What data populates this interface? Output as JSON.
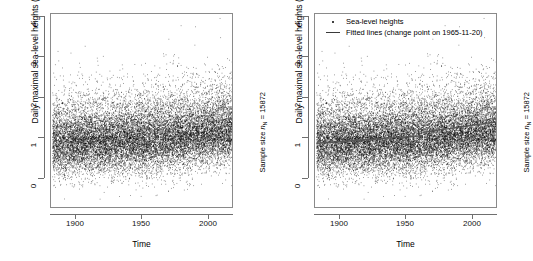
{
  "figure": {
    "panels": [
      {
        "id": "left",
        "axis_x_title": "Time",
        "axis_y_title": "Daily maximal sea-level heights (in m above NAP) of winters",
        "side_note_prefix": "Sample size ",
        "side_note_symbol": "n",
        "side_note_subscript": "N",
        "side_note_suffix": " = 15872",
        "has_legend": false
      },
      {
        "id": "right",
        "axis_x_title": "Time",
        "axis_y_title": "Daily maximal sea-level heights (in m above NAP) of winters",
        "side_note_prefix": "Sample size ",
        "side_note_symbol": "n",
        "side_note_subscript": "N",
        "side_note_suffix": " = 15872",
        "has_legend": true,
        "legend": {
          "points_label": "Sea-level heights",
          "line_label": "Fitted lines (change point on 1965-11-20)"
        }
      }
    ]
  },
  "chart_data": [
    {
      "type": "scatter",
      "title": "",
      "xlabel": "Time",
      "ylabel": "Daily maximal sea-level heights (in m above NAP) of winters",
      "xlim": [
        1886,
        2020
      ],
      "ylim": [
        -0.6,
        4.0
      ],
      "xticks": [
        1900,
        1950,
        2000
      ],
      "yticks": [
        0,
        1,
        2,
        3,
        4
      ],
      "grid": false,
      "legend": null,
      "annotation": "Sample size nN = 15872",
      "n_points": 15872,
      "point_color": "#000000",
      "description": "Dense black scatter cloud of daily maximal winter sea-level heights from ~1887 to ~2020; bulk of mass between 0.4 and 1.9 m, centred near 1.0-1.2 m, with sparse outliers up to 3.8 m and down to -0.45 m.",
      "density_profile": {
        "x_years": [
          1887,
          1900,
          1920,
          1940,
          1960,
          1980,
          2000,
          2020
        ],
        "median": [
          0.95,
          0.97,
          1.0,
          1.02,
          1.05,
          1.12,
          1.2,
          1.25
        ],
        "q25": [
          0.72,
          0.74,
          0.78,
          0.8,
          0.83,
          0.88,
          0.96,
          1.0
        ],
        "q75": [
          1.25,
          1.27,
          1.3,
          1.33,
          1.36,
          1.42,
          1.5,
          1.55
        ],
        "p05": [
          0.4,
          0.42,
          0.45,
          0.46,
          0.48,
          0.52,
          0.6,
          0.65
        ],
        "p95": [
          1.75,
          1.78,
          1.8,
          1.85,
          1.88,
          1.95,
          2.05,
          2.1
        ]
      }
    },
    {
      "type": "scatter",
      "title": "",
      "xlabel": "Time",
      "ylabel": "Daily maximal sea-level heights (in m above NAP) of winters",
      "xlim": [
        1886,
        2020
      ],
      "ylim": [
        -0.6,
        4.0
      ],
      "xticks": [
        1900,
        1950,
        2000
      ],
      "yticks": [
        0,
        1,
        2,
        3,
        4
      ],
      "grid": false,
      "legend": {
        "position": "top-left",
        "entries": [
          "Sea-level heights",
          "Fitted lines (change point on 1965-11-20)"
        ]
      },
      "annotation": "Sample size nN = 15872",
      "n_points": 15872,
      "point_color": "#000000",
      "line_color": "#555555",
      "change_point": "1965-11-20",
      "fitted_lines": [
        {
          "segment": "before-change-point",
          "x": [
            1887,
            1965.89
          ],
          "y": [
            0.92,
            1.1
          ]
        },
        {
          "segment": "after-change-point",
          "x": [
            1965.89,
            2020
          ],
          "y": [
            1.18,
            1.43
          ]
        }
      ],
      "description": "Same scatter cloud as the left panel, overlaid with two fitted straight-line segments meeting at the change point 1965-11-20: a shallow upward trend before, and a steeper upward trend after.",
      "density_profile": {
        "x_years": [
          1887,
          1900,
          1920,
          1940,
          1960,
          1980,
          2000,
          2020
        ],
        "median": [
          0.95,
          0.97,
          1.0,
          1.02,
          1.05,
          1.12,
          1.2,
          1.25
        ],
        "q25": [
          0.72,
          0.74,
          0.78,
          0.8,
          0.83,
          0.88,
          0.96,
          1.0
        ],
        "q75": [
          1.25,
          1.27,
          1.3,
          1.33,
          1.36,
          1.42,
          1.5,
          1.55
        ],
        "p05": [
          0.4,
          0.42,
          0.45,
          0.46,
          0.48,
          0.52,
          0.6,
          0.65
        ],
        "p95": [
          1.75,
          1.78,
          1.8,
          1.85,
          1.88,
          1.95,
          2.05,
          2.1
        ]
      }
    }
  ]
}
